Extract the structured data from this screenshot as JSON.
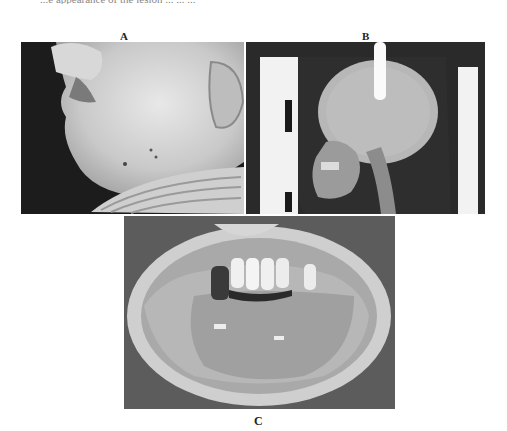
{
  "figure": {
    "top_caption_fragment": "...e appearance of the lesion ... ... ...",
    "panels": [
      {
        "id": "A",
        "label": "A",
        "description": "Lateral photograph of patient's face showing swelling of the lower face and jaw"
      },
      {
        "id": "B",
        "label": "B",
        "description": "Lateral skull radiograph"
      },
      {
        "id": "C",
        "label": "C",
        "description": "Intraoral photograph showing upper anterior teeth and lesion of the oral mucosa"
      }
    ]
  }
}
